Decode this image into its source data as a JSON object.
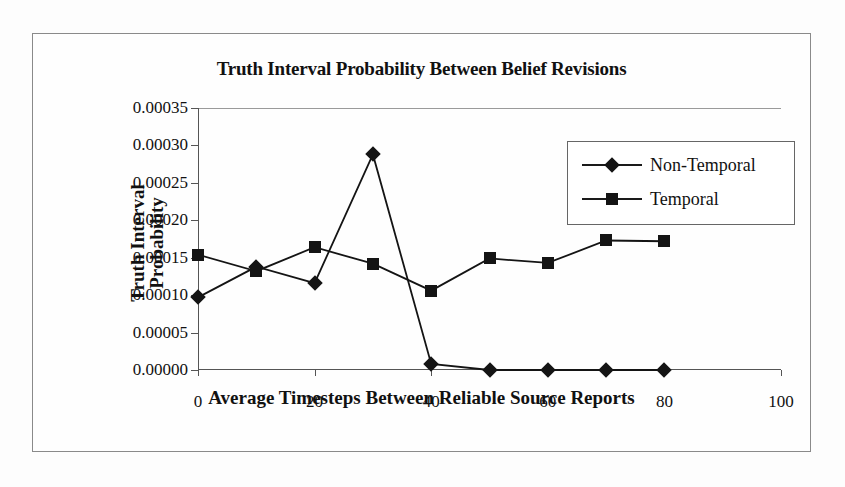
{
  "chart_data": {
    "type": "line",
    "title": "Truth Interval Probability Between Belief Revisions",
    "xlabel": "Average Timesteps Between Reliable Source Reports",
    "ylabel": "Truth Interval Probability",
    "ylabel_line1": "Truth Interval",
    "ylabel_line2": "Probability",
    "x": [
      0,
      10,
      20,
      30,
      40,
      50,
      60,
      70,
      80
    ],
    "xlim": [
      0,
      100
    ],
    "ylim": [
      0.0,
      0.00035
    ],
    "grid": false,
    "legend_position": "top-right",
    "xticks": [
      "0",
      "20",
      "40",
      "60",
      "80",
      "100"
    ],
    "xtick_values": [
      0,
      20,
      40,
      60,
      80,
      100
    ],
    "yticks": [
      "0.00000",
      "0.00005",
      "0.00010",
      "0.00015",
      "0.00020",
      "0.00025",
      "0.00030",
      "0.00035"
    ],
    "ytick_values": [
      0.0,
      5e-05,
      0.0001,
      0.00015,
      0.0002,
      0.00025,
      0.0003,
      0.00035
    ],
    "series": [
      {
        "name": "Non-Temporal",
        "marker": "diamond",
        "color": "#141414",
        "values": [
          9.7e-05,
          0.000138,
          0.000116,
          0.000288,
          8e-06,
          0.0,
          0.0,
          0.0,
          0.0
        ]
      },
      {
        "name": "Temporal",
        "marker": "square",
        "color": "#141414",
        "values": [
          0.000154,
          0.000132,
          0.000164,
          0.000142,
          0.000106,
          0.000149,
          0.000143,
          0.000173,
          0.000172
        ]
      }
    ]
  },
  "legend": {
    "entries": [
      {
        "label": "Non-Temporal"
      },
      {
        "label": "Temporal"
      }
    ]
  }
}
